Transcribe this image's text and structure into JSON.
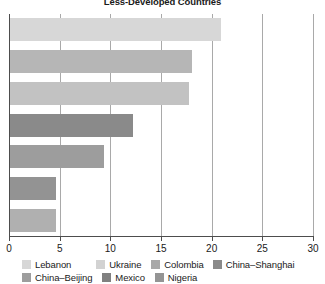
{
  "chart_data": {
    "type": "bar",
    "orientation": "horizontal",
    "title": "Less-Developed Countries",
    "xlabel": "",
    "ylabel": "",
    "xlim": [
      0,
      30
    ],
    "xticks": [
      0,
      5,
      10,
      15,
      20,
      25,
      30
    ],
    "xtick_labels": [
      "0",
      "5",
      "10",
      "15",
      "20",
      "25",
      "30"
    ],
    "grid": "vertical",
    "legend_position": "bottom",
    "categories": [
      "Lebanon",
      "Ukraine",
      "Colombia",
      "China–Shanghai",
      "China–Beijing",
      "Mexico",
      "Nigeria"
    ],
    "values": [
      20.9,
      18.1,
      17.8,
      12.2,
      9.4,
      4.6,
      4.6
    ],
    "colors": [
      "#d7d7d7",
      "#b6b6b6",
      "#c2c2c2",
      "#8a8a8a",
      "#9d9d9d",
      "#939393",
      "#b0b0b0"
    ],
    "series": [
      {
        "name": "Less-Developed Countries",
        "values": [
          20.9,
          18.1,
          17.8,
          12.2,
          9.4,
          4.6,
          4.6
        ]
      }
    ]
  },
  "legend": {
    "row1": [
      {
        "label": "Lebanon",
        "color": "#d7d7d7"
      },
      {
        "label": "Ukraine",
        "color": "#d2d2d2"
      },
      {
        "label": "Colombia",
        "color": "#a8a8a8"
      },
      {
        "label": "China–Shanghai",
        "color": "#8a8a8a"
      }
    ],
    "row2": [
      {
        "label": "China–Beijing",
        "color": "#9d9d9d"
      },
      {
        "label": "Mexico",
        "color": "#808080"
      },
      {
        "label": "Nigeria",
        "color": "#949494"
      }
    ]
  },
  "style": {
    "axis_color": "#4d4d4d",
    "grid_color": "#a9a9a9",
    "text_color": "#1a1a1a",
    "background": "#ffffff"
  }
}
